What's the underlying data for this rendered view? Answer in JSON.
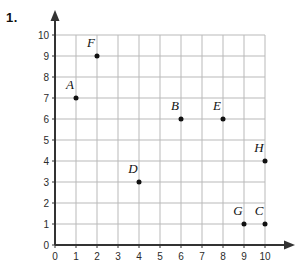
{
  "problem": {
    "number": "1."
  },
  "chart_data": {
    "type": "scatter",
    "title": "",
    "xlabel": "",
    "ylabel": "",
    "xlim": [
      0,
      10
    ],
    "ylim": [
      0,
      10
    ],
    "grid": true,
    "legend": false,
    "x_ticks": [
      "0",
      "1",
      "2",
      "3",
      "4",
      "5",
      "6",
      "7",
      "8",
      "9",
      "10"
    ],
    "y_ticks": [
      "0",
      "1",
      "2",
      "3",
      "4",
      "5",
      "6",
      "7",
      "8",
      "9",
      "10"
    ],
    "points": [
      {
        "label": "A",
        "x": 1,
        "y": 7
      },
      {
        "label": "F",
        "x": 2,
        "y": 9
      },
      {
        "label": "D",
        "x": 4,
        "y": 3
      },
      {
        "label": "B",
        "x": 6,
        "y": 6
      },
      {
        "label": "E",
        "x": 8,
        "y": 6
      },
      {
        "label": "G",
        "x": 9,
        "y": 1
      },
      {
        "label": "C",
        "x": 10,
        "y": 1
      },
      {
        "label": "H",
        "x": 10,
        "y": 4
      }
    ],
    "colors": {
      "grid": "#b9b9b9",
      "axis": "#333333",
      "point": "#111111",
      "text": "#111111"
    }
  }
}
